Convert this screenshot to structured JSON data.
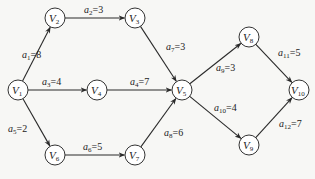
{
  "diagram": {
    "type": "directed-weighted-graph (AOE network)",
    "nodes": [
      {
        "id": "V1",
        "base": "V",
        "sub": "1",
        "x": 18,
        "y": 90
      },
      {
        "id": "V2",
        "base": "V",
        "sub": "2",
        "x": 55,
        "y": 18
      },
      {
        "id": "V3",
        "base": "V",
        "sub": "3",
        "x": 135,
        "y": 18
      },
      {
        "id": "V4",
        "base": "V",
        "sub": "4",
        "x": 97,
        "y": 90
      },
      {
        "id": "V5",
        "base": "V",
        "sub": "5",
        "x": 182,
        "y": 90
      },
      {
        "id": "V6",
        "base": "V",
        "sub": "6",
        "x": 55,
        "y": 155
      },
      {
        "id": "V7",
        "base": "V",
        "sub": "7",
        "x": 135,
        "y": 155
      },
      {
        "id": "V8",
        "base": "V",
        "sub": "8",
        "x": 249,
        "y": 37
      },
      {
        "id": "V9",
        "base": "V",
        "sub": "9",
        "x": 249,
        "y": 145
      },
      {
        "id": "V10",
        "base": "V",
        "sub": "10",
        "x": 299,
        "y": 90
      }
    ],
    "edges": [
      {
        "id": "a1",
        "from": "V1",
        "to": "V2",
        "name": "a",
        "sub": "1",
        "weight": "8",
        "lx": 22,
        "ly": 58
      },
      {
        "id": "a2",
        "from": "V2",
        "to": "V3",
        "name": "a",
        "sub": "2",
        "weight": "3",
        "lx": 84,
        "ly": 13
      },
      {
        "id": "a3",
        "from": "V1",
        "to": "V4",
        "name": "a",
        "sub": "3",
        "weight": "4",
        "lx": 42,
        "ly": 85
      },
      {
        "id": "a4",
        "from": "V4",
        "to": "V5",
        "name": "a",
        "sub": "4",
        "weight": "7",
        "lx": 130,
        "ly": 85
      },
      {
        "id": "a5",
        "from": "V1",
        "to": "V6",
        "name": "a",
        "sub": "5",
        "weight": "2",
        "lx": 8,
        "ly": 132
      },
      {
        "id": "a6",
        "from": "V6",
        "to": "V7",
        "name": "a",
        "sub": "6",
        "weight": "5",
        "lx": 83,
        "ly": 150
      },
      {
        "id": "a7",
        "from": "V3",
        "to": "V5",
        "name": "a",
        "sub": "7",
        "weight": "3",
        "lx": 166,
        "ly": 50
      },
      {
        "id": "a8",
        "from": "V7",
        "to": "V5",
        "name": "a",
        "sub": "8",
        "weight": "6",
        "lx": 164,
        "ly": 136
      },
      {
        "id": "a9",
        "from": "V5",
        "to": "V8",
        "name": "a",
        "sub": "9",
        "weight": "3",
        "lx": 216,
        "ly": 71
      },
      {
        "id": "a10",
        "from": "V5",
        "to": "V9",
        "name": "a",
        "sub": "10",
        "weight": "4",
        "lx": 214,
        "ly": 111
      },
      {
        "id": "a11",
        "from": "V8",
        "to": "V10",
        "name": "a",
        "sub": "11",
        "weight": "5",
        "lx": 278,
        "ly": 56
      },
      {
        "id": "a12",
        "from": "V9",
        "to": "V10",
        "name": "a",
        "sub": "12",
        "weight": "7",
        "lx": 279,
        "ly": 127
      }
    ],
    "colors": {
      "stroke": "#2a2a2a",
      "background": "#f7f7f5",
      "node_fill": "#ffffff",
      "text": "#222222"
    }
  }
}
